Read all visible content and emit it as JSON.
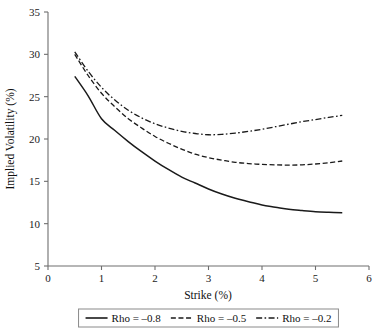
{
  "chart_data": {
    "type": "line",
    "title": "",
    "xlabel": "Strike (%)",
    "ylabel": "Implied Volatility (%)",
    "xlim": [
      0,
      6
    ],
    "ylim": [
      5,
      35
    ],
    "xticks": [
      "0",
      "1",
      "2",
      "3",
      "4",
      "5",
      "6"
    ],
    "yticks": [
      "5",
      "10",
      "15",
      "20",
      "25",
      "30",
      "35"
    ],
    "xtick_values": [
      0,
      1,
      2,
      3,
      4,
      5,
      6
    ],
    "ytick_values": [
      5,
      10,
      15,
      20,
      25,
      30,
      35
    ],
    "grid": false,
    "legend_position": "below-axes",
    "x": [
      0.5,
      0.75,
      1.0,
      1.25,
      1.5,
      1.75,
      2.0,
      2.25,
      2.5,
      2.75,
      3.0,
      3.25,
      3.5,
      3.75,
      4.0,
      4.25,
      4.5,
      4.75,
      5.0,
      5.25,
      5.5
    ],
    "series": [
      {
        "name": "Rho = −0.8",
        "label": "Rho = –0.8",
        "style": "solid",
        "color": "#1a1a1a",
        "values": [
          27.4,
          25.1,
          22.4,
          21.0,
          19.7,
          18.5,
          17.4,
          16.4,
          15.5,
          14.8,
          14.1,
          13.5,
          13.0,
          12.6,
          12.2,
          11.95,
          11.7,
          11.55,
          11.42,
          11.35,
          11.3
        ]
      },
      {
        "name": "Rho = −0.5",
        "label": "Rho = –0.5",
        "style": "dashed",
        "color": "#1a1a1a",
        "values": [
          30.0,
          27.5,
          25.4,
          23.8,
          22.4,
          21.3,
          20.3,
          19.5,
          18.8,
          18.2,
          17.8,
          17.5,
          17.25,
          17.1,
          17.0,
          16.95,
          16.92,
          16.95,
          17.05,
          17.2,
          17.4
        ]
      },
      {
        "name": "Rho = −0.2",
        "label": "Rho = –0.2",
        "style": "dashdot",
        "color": "#1a1a1a",
        "values": [
          30.3,
          28.0,
          26.1,
          24.6,
          23.4,
          22.5,
          21.8,
          21.3,
          20.9,
          20.65,
          20.5,
          20.55,
          20.7,
          20.9,
          21.15,
          21.45,
          21.75,
          22.05,
          22.3,
          22.55,
          22.8
        ]
      }
    ]
  },
  "legend": {
    "items": [
      {
        "label": "Rho = –0.8",
        "style": "solid"
      },
      {
        "label": "Rho = –0.5",
        "style": "dashed"
      },
      {
        "label": "Rho = –0.2",
        "style": "dashdot"
      }
    ]
  },
  "axes": {
    "x_title": "Strike (%)",
    "y_title": "Implied Volatility (%)"
  },
  "colors": {
    "line": "#1a1a1a",
    "axis": "#6e6e6e",
    "text": "#111111",
    "background": "#ffffff"
  }
}
